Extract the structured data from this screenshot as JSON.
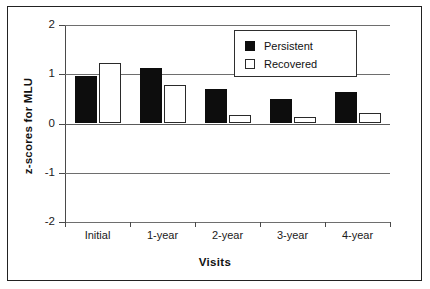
{
  "chart_data": {
    "type": "bar",
    "title": "",
    "xlabel": "Visits",
    "ylabel": "z-scores for MLU",
    "categories": [
      "Initial",
      "1-year",
      "2-year",
      "3-year",
      "4-year"
    ],
    "series": [
      {
        "name": "Persistent",
        "color": "#0d0d0d",
        "fill": "solid",
        "values": [
          0.96,
          1.13,
          0.7,
          0.49,
          0.63
        ]
      },
      {
        "name": "Recovered",
        "color": "#ffffff",
        "fill": "hollow",
        "values": [
          1.23,
          0.78,
          0.17,
          0.14,
          0.21
        ]
      }
    ],
    "ylim": [
      -2,
      2
    ],
    "yticks": [
      2,
      1,
      0,
      -1,
      -2
    ],
    "ytick_labels": [
      "2",
      "1",
      "0",
      "-1",
      "-2"
    ],
    "grid": true,
    "legend_position": "top-right"
  },
  "legend": {
    "entries": [
      {
        "label": "Persistent",
        "swatch": "filled-square"
      },
      {
        "label": "Recovered",
        "swatch": "hollow-square"
      }
    ]
  }
}
